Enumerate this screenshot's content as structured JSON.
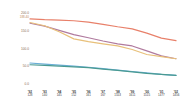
{
  "chart_data": {
    "type": "line",
    "title": "",
    "subtitle": "",
    "xlabel": "",
    "ylabel": "",
    "grid": false,
    "legend_position": "none",
    "ylim": [
      0.0,
      200.0
    ],
    "ytick_labels": [
      "200.0",
      "150.0",
      "100.0",
      "50.0",
      "0.0"
    ],
    "ytick_values": [
      200.0,
      150.0,
      100.0,
      50.0,
      0.0
    ],
    "ytop_annotation": "188.40",
    "categories": [
      "'92",
      "'93",
      "'94",
      "'95",
      "'96",
      "'97",
      "'98",
      "'99",
      "'00",
      "'01",
      "'02"
    ],
    "xtick_sublabels": [
      "128",
      "140",
      "145",
      "152",
      "161",
      "167",
      "1553",
      "1611",
      "1515",
      "1477",
      "1456"
    ],
    "series": [
      {
        "name": "series-1",
        "color": "#e8806a",
        "values": [
          186.0,
          184.0,
          183.0,
          181.0,
          177.0,
          171.0,
          164.0,
          158.0,
          146.0,
          132.0,
          125.0
        ]
      },
      {
        "name": "series-2",
        "color": "#b07a9e",
        "values": [
          174.0,
          166.0,
          154.0,
          142.0,
          133.0,
          124.0,
          116.0,
          110.0,
          96.0,
          82.0,
          74.0
        ]
      },
      {
        "name": "series-3",
        "color": "#e8c07a",
        "values": [
          176.0,
          167.0,
          150.0,
          130.0,
          122.0,
          116.0,
          110.0,
          100.0,
          86.0,
          80.0,
          74.0
        ]
      },
      {
        "name": "series-4",
        "color": "#6aaed6",
        "values": [
          62.0,
          59.0,
          56.0,
          53.0,
          50.0,
          46.0,
          42.0,
          38.0,
          34.0,
          30.0,
          27.0
        ]
      },
      {
        "name": "series-5",
        "color": "#4a9a92",
        "values": [
          57.0,
          55.0,
          53.0,
          51.0,
          49.0,
          45.0,
          41.0,
          37.0,
          33.0,
          30.0,
          27.0
        ]
      }
    ]
  }
}
